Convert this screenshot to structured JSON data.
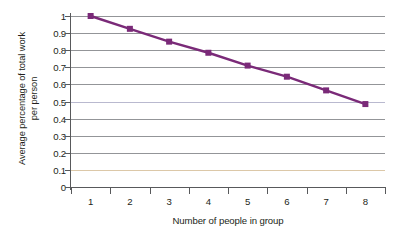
{
  "chart_data": {
    "type": "line",
    "title": "",
    "xlabel": "Number of people in group",
    "ylabel_lines": [
      "Average percentage of total work",
      "per person"
    ],
    "ylabel": "Average percentage of total work per person",
    "categories": [
      1,
      2,
      3,
      4,
      5,
      6,
      7,
      8
    ],
    "x_tick_labels": [
      "1",
      "2",
      "3",
      "4",
      "5",
      "6",
      "7",
      "8"
    ],
    "values": [
      1.0,
      0.925,
      0.85,
      0.785,
      0.71,
      0.645,
      0.565,
      0.485
    ],
    "series": [
      {
        "name": "Average percentage of total work per person",
        "values": [
          1.0,
          0.925,
          0.85,
          0.785,
          0.71,
          0.645,
          0.565,
          0.485
        ],
        "color": "#7a2a78",
        "marker": "square",
        "marker_size": 6
      }
    ],
    "ylim": [
      0,
      1
    ],
    "xlim": [
      0.5,
      8.5
    ],
    "y_tick_labels": [
      "1",
      "0.9",
      "0.8",
      "0.7",
      "0.6",
      "0.5",
      "0.4",
      "0.3",
      "0.2",
      "0.1",
      "0"
    ],
    "y_tick_values": [
      1,
      0.9,
      0.8,
      0.7,
      0.6,
      0.5,
      0.4,
      0.3,
      0.2,
      0.1,
      0
    ],
    "grid": true,
    "grid_color": "#939598",
    "legend": "none",
    "background": "#ffffff",
    "axis_color": "#58595b",
    "text_color": "#231f20"
  }
}
